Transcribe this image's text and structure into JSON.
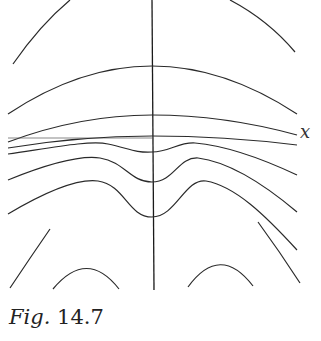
{
  "figure": {
    "caption_prefix": "Fig.",
    "caption_number": "14.7",
    "axis_label_x": "x",
    "stroke_color": "#2a2a2a",
    "background": "#ffffff"
  }
}
